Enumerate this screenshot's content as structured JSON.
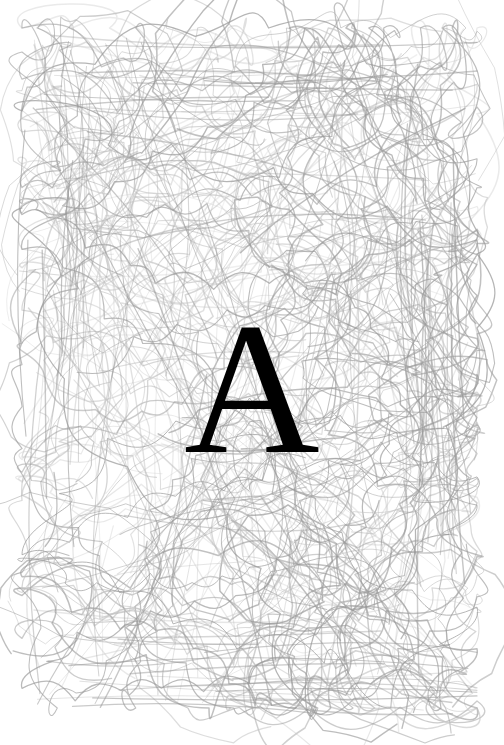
{
  "artwork": {
    "title": "Letter A over pencil scribble field",
    "background_color": "#ffffff",
    "letter": {
      "character": "A",
      "color": "#000000",
      "style": "serif",
      "cap_height_px": 131,
      "bounds": {
        "x": 190,
        "y": 342,
        "width": 122,
        "height": 131
      }
    },
    "scribble": {
      "stroke_color": "#9a9a9a",
      "stroke_color_light": "#c4c4c4",
      "stroke_width": 1.1,
      "opacity": 0.75,
      "region": {
        "x": 22,
        "y": 28,
        "width": 455,
        "height": 680
      },
      "description": "dense overlapping freehand loops and long sweeping arcs"
    }
  },
  "chart_data": {
    "type": "scatter",
    "xlabel": "",
    "ylabel": "",
    "seed": 20240517,
    "stroke_count": 360,
    "xlim": [
      22,
      477
    ],
    "ylim": [
      28,
      708
    ]
  }
}
